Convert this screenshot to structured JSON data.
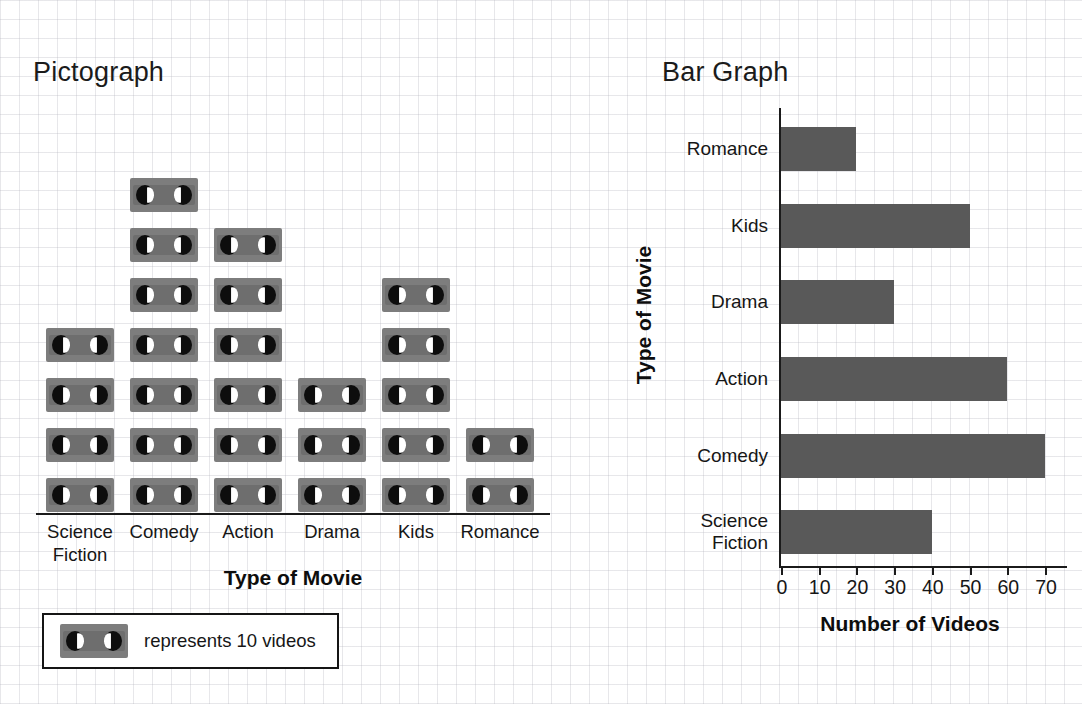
{
  "pictograph": {
    "title": "Pictograph",
    "xaxis_title": "Type of Movie",
    "categories": [
      "Science\nFiction",
      "Comedy",
      "Action",
      "Drama",
      "Kids",
      "Romance"
    ],
    "icon_counts": [
      4,
      7,
      6,
      3,
      5,
      2
    ],
    "legend": {
      "icon": "vhs-cassette-icon",
      "text": "represents 10 videos",
      "unit_value": 10
    }
  },
  "bargraph": {
    "title": "Bar Graph",
    "xaxis_title": "Number of Videos",
    "yaxis_title": "Type of Movie",
    "ticks": [
      "0",
      "10",
      "20",
      "30",
      "40",
      "50",
      "60",
      "70"
    ],
    "rows": [
      {
        "label": "Romance",
        "value": 20
      },
      {
        "label": "Kids",
        "value": 50
      },
      {
        "label": "Drama",
        "value": 30
      },
      {
        "label": "Action",
        "value": 60
      },
      {
        "label": "Comedy",
        "value": 70
      },
      {
        "label": "Science\nFiction",
        "value": 40
      }
    ]
  },
  "colors": {
    "bar_fill": "#595959",
    "icon_body": "#7d7d7d",
    "icon_reel": "#0d0d0d",
    "icon_hub": "#ffffff",
    "axis": "#1b1b1b",
    "text": "#161616",
    "background": "#ffffff",
    "grid": "#b0b0ba"
  },
  "chart_data": [
    {
      "type": "bar",
      "orientation": "pictograph",
      "title": "Pictograph",
      "xlabel": "Type of Movie",
      "ylabel": "",
      "categories": [
        "Science Fiction",
        "Comedy",
        "Action",
        "Drama",
        "Kids",
        "Romance"
      ],
      "values": [
        40,
        70,
        60,
        30,
        50,
        20
      ],
      "icon_counts": [
        4,
        7,
        6,
        3,
        5,
        2
      ],
      "icon_unit": 10,
      "legend": "represents 10 videos",
      "legend_position": "below-axis-left",
      "grid": false
    },
    {
      "type": "bar",
      "orientation": "horizontal",
      "title": "Bar Graph",
      "xlabel": "Number of Videos",
      "ylabel": "Type of Movie",
      "categories": [
        "Romance",
        "Kids",
        "Drama",
        "Action",
        "Comedy",
        "Science Fiction"
      ],
      "values": [
        20,
        50,
        30,
        60,
        70,
        40
      ],
      "xlim": [
        0,
        70
      ],
      "xticks": [
        0,
        10,
        20,
        30,
        40,
        50,
        60,
        70
      ],
      "grid": false,
      "bar_color": "#595959"
    }
  ]
}
